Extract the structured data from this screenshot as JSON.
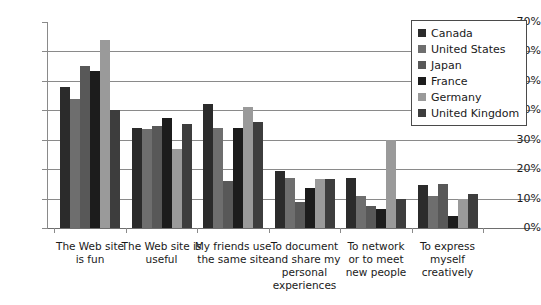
{
  "chart_data": {
    "type": "bar",
    "title": "",
    "xlabel": "",
    "ylabel": "",
    "ylim": [
      0,
      70
    ],
    "y_tick_labels": [
      "70%",
      "60%",
      "50%",
      "40%",
      "30%",
      "20%",
      "10%",
      "0%"
    ],
    "y_ticks": [
      70,
      60,
      50,
      40,
      30,
      20,
      10,
      0
    ],
    "grid": true,
    "legend_position": "top-right",
    "categories": [
      "The Web site is fun",
      "The Web site is useful",
      "My friends use the same site",
      "To document and share my personal experiences",
      "To network or to meet new people",
      "To express myself creatively"
    ],
    "category_lines": [
      [
        "The Web site",
        "is fun"
      ],
      [
        "The Web site is",
        "useful"
      ],
      [
        "My friends use",
        "the same site"
      ],
      [
        "To document",
        "and share my",
        "personal",
        "experiences"
      ],
      [
        "To network",
        "or to meet",
        "new people"
      ],
      [
        "To express",
        "myself creatively"
      ]
    ],
    "series": [
      {
        "name": "Canada",
        "color": "#2b2b2b",
        "values": [
          48,
          34,
          42,
          19.5,
          17,
          14.5
        ]
      },
      {
        "name": "United States",
        "color": "#6e6e6e",
        "values": [
          44,
          33.5,
          34,
          17,
          11,
          11
        ]
      },
      {
        "name": "Japan",
        "color": "#585858",
        "values": [
          55,
          34.5,
          16,
          9,
          7.5,
          15
        ]
      },
      {
        "name": "France",
        "color": "#1c1c1c",
        "values": [
          53.5,
          37.5,
          34,
          13.5,
          6.5,
          4
        ]
      },
      {
        "name": "Germany",
        "color": "#9a9a9a",
        "values": [
          64,
          27,
          41,
          16.5,
          30,
          10
        ]
      },
      {
        "name": "United Kingdom",
        "color": "#3d3d3d",
        "values": [
          40,
          35.5,
          36,
          16.5,
          10,
          11.5
        ]
      }
    ]
  },
  "legend": {
    "entries": [
      "Canada",
      "United States",
      "Japan",
      "France",
      "Germany",
      "United Kingdom"
    ]
  },
  "colors": {
    "background": "#ffffff",
    "axis": "#8a8a8a",
    "gridline": "#8a8a8a",
    "text": "#1a1a1a",
    "legend_border": "#4a4a4a"
  }
}
